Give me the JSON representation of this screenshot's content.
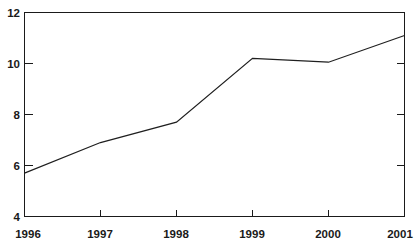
{
  "chart_data": {
    "type": "line",
    "title": "",
    "subtitle": "",
    "xlabel": "",
    "ylabel": "",
    "categories": [
      "1996",
      "1997",
      "1998",
      "1999",
      "2000",
      "2001"
    ],
    "x": [
      1996,
      1997,
      1998,
      1999,
      2000,
      2001
    ],
    "values": [
      5.7,
      6.9,
      7.7,
      10.2,
      10.05,
      11.1
    ],
    "series": [
      {
        "name": "series-1",
        "values": [
          5.7,
          6.9,
          7.7,
          10.2,
          10.05,
          11.1
        ]
      }
    ],
    "xlim": [
      1996,
      2001
    ],
    "ylim": [
      4,
      12
    ],
    "y_ticks": [
      4,
      6,
      8,
      10,
      12
    ],
    "y_tick_labels": [
      "4",
      "6",
      "8",
      "10",
      "12"
    ],
    "x_ticks": [
      1996,
      1997,
      1998,
      1999,
      2000,
      2001
    ],
    "x_tick_labels": [
      "1996",
      "1997",
      "1998",
      "1999",
      "2000",
      "2001"
    ],
    "grid": false,
    "legend": false,
    "legend_position": "none",
    "annotations": [],
    "line_color": "#1f1f1f",
    "axis_color": "#1a1a1a",
    "background_color": "#ffffff",
    "frame": "full-box"
  },
  "axes": {
    "y_labels": [
      "12",
      "10",
      "8",
      "6",
      "4"
    ],
    "x_labels": [
      "1996",
      "1997",
      "1998",
      "1999",
      "2000",
      "2001"
    ]
  }
}
